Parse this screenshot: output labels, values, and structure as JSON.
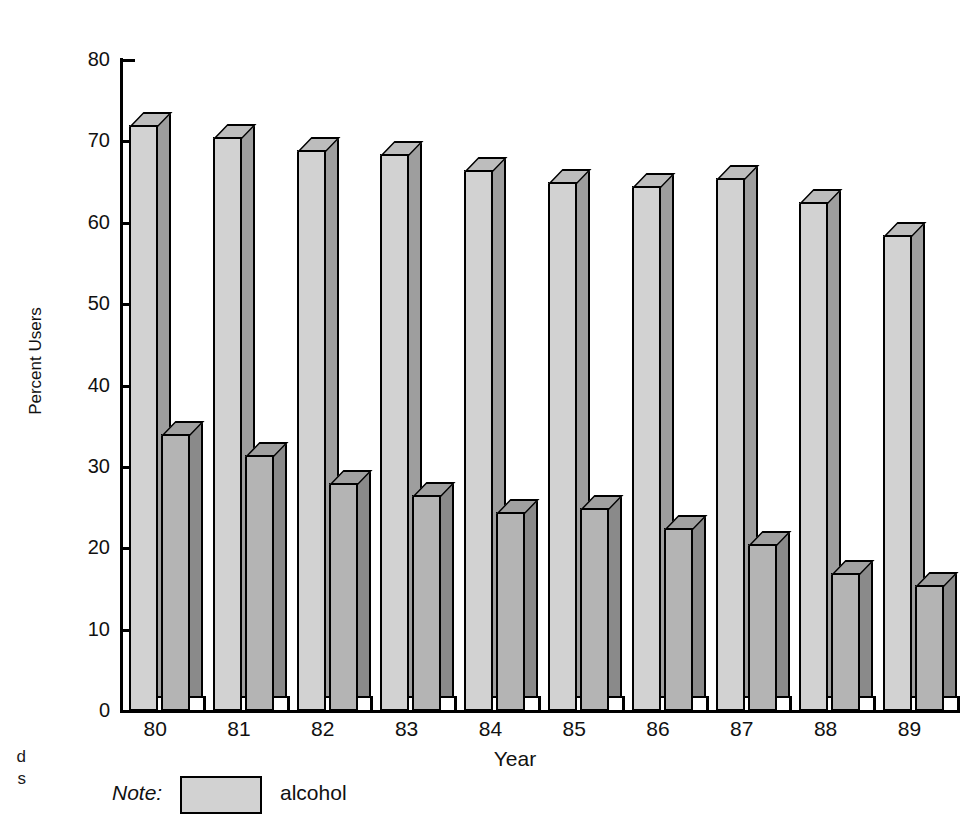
{
  "figure": {
    "gutter_text_line1": "d",
    "gutter_text_line2": "s"
  },
  "note": {
    "label": "Note:",
    "legend_label": "alcohol",
    "swatch_color": "#d2d2d2"
  },
  "chart_data": {
    "type": "bar",
    "title": "",
    "xlabel": "Year",
    "ylabel": "Percent Users",
    "categories": [
      "80",
      "81",
      "82",
      "83",
      "84",
      "85",
      "86",
      "87",
      "88",
      "89"
    ],
    "ylim": [
      0,
      80
    ],
    "yticks": [
      0,
      10,
      20,
      30,
      40,
      50,
      60,
      70,
      80
    ],
    "ytick_labels": [
      "0",
      "10",
      "20",
      "30",
      "40",
      "50",
      "60",
      "70",
      "80"
    ],
    "grid": false,
    "legend_position": "below-axis-left",
    "series": [
      {
        "name": "alcohol",
        "color": "#d2d2d2",
        "values": [
          72,
          70.5,
          69,
          68.5,
          66.5,
          65,
          64.5,
          65.5,
          62.5,
          58.5
        ]
      },
      {
        "name": "series-2",
        "color": "#b4b4b4",
        "values": [
          34,
          31.5,
          28,
          26.5,
          24.5,
          25,
          22.5,
          20.5,
          17,
          15.5
        ]
      }
    ]
  }
}
